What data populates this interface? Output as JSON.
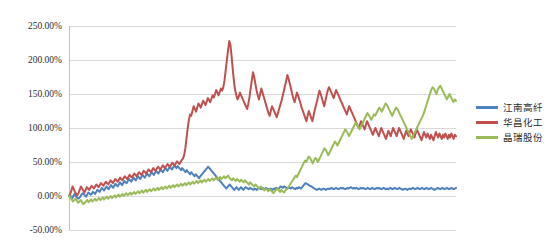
{
  "chart_data": {
    "type": "line",
    "title": "",
    "subtitle": "",
    "xlabel": "",
    "ylabel": "",
    "ylim": [
      -50,
      250
    ],
    "ytick_labels": [
      "250.00%",
      "200.00%",
      "150.00%",
      "100.00%",
      "50.00%",
      "0.00%",
      "-50.00%"
    ],
    "ytick_values": [
      250,
      200,
      150,
      100,
      50,
      0,
      -50
    ],
    "xtick_labels": [],
    "grid": "horizontal",
    "legend_position": "right",
    "colors": {
      "jiangnan": "#4F81BD",
      "huachang": "#C0504D",
      "jingrui": "#9BBB59",
      "gridline": "#D9D9D9",
      "axis": "#BFBFBF",
      "text": "#2B2B2B"
    },
    "series": [
      {
        "name": "江南高纤",
        "color": "#4F81BD",
        "values": [
          0,
          1,
          -2,
          -3,
          1,
          3,
          0,
          -2,
          -4,
          -3,
          -1,
          2,
          4,
          3,
          1,
          -1,
          2,
          5,
          4,
          2,
          3,
          6,
          5,
          3,
          6,
          9,
          8,
          6,
          9,
          12,
          10,
          8,
          11,
          14,
          12,
          10,
          13,
          16,
          14,
          12,
          15,
          18,
          16,
          14,
          17,
          20,
          18,
          16,
          19,
          22,
          20,
          19,
          22,
          25,
          23,
          21,
          24,
          27,
          25,
          23,
          26,
          29,
          27,
          25,
          28,
          31,
          29,
          27,
          30,
          33,
          31,
          29,
          32,
          35,
          33,
          31,
          34,
          37,
          35,
          33,
          36,
          39,
          37,
          35,
          38,
          41,
          39,
          37,
          40,
          43,
          41,
          39,
          42,
          45,
          43,
          41,
          44,
          42,
          40,
          38,
          41,
          39,
          37,
          35,
          38,
          36,
          34,
          32,
          35,
          33,
          31,
          29,
          32,
          30,
          28,
          26,
          29,
          31,
          33,
          35,
          37,
          39,
          41,
          43,
          41,
          39,
          37,
          35,
          33,
          31,
          29,
          27,
          25,
          23,
          21,
          19,
          17,
          15,
          13,
          11,
          13,
          15,
          17,
          15,
          13,
          11,
          9,
          11,
          13,
          11,
          9,
          11,
          13,
          11,
          9,
          11,
          13,
          12,
          11,
          10,
          12,
          11,
          10,
          9,
          11,
          10,
          9,
          11,
          12,
          11,
          10,
          12,
          11,
          10,
          12,
          11,
          10,
          9,
          11,
          10,
          9,
          11,
          10,
          12,
          11,
          10,
          12,
          14,
          13,
          12,
          14,
          13,
          12,
          11,
          13,
          12,
          11,
          13,
          12,
          11,
          10,
          12,
          11,
          13,
          12,
          11,
          13,
          15,
          17,
          19,
          18,
          17,
          16,
          15,
          14,
          13,
          12,
          11,
          10,
          9,
          10,
          11,
          10,
          9,
          10,
          11,
          10,
          9,
          10,
          11,
          10,
          11,
          12,
          11,
          10,
          11,
          12,
          11,
          10,
          11,
          12,
          11,
          12,
          11,
          10,
          11,
          12,
          11,
          12,
          13,
          12,
          11,
          12,
          11,
          12,
          11,
          10,
          11,
          12,
          11,
          12,
          11,
          10,
          11,
          12,
          11,
          10,
          11,
          12,
          11,
          10,
          11,
          12,
          11,
          12,
          11,
          10,
          11,
          12,
          11,
          10,
          11,
          10,
          11,
          12,
          11,
          10,
          11,
          12,
          11,
          10,
          11,
          12,
          11,
          10,
          9,
          10,
          11,
          10,
          9,
          10,
          11,
          10,
          11,
          12,
          11,
          10,
          11,
          12,
          11,
          10,
          11,
          12,
          11,
          10,
          11,
          12,
          11,
          10,
          11,
          12,
          11,
          10,
          9,
          10,
          11,
          12,
          11,
          10,
          11,
          12,
          11,
          10,
          11,
          12,
          11,
          10,
          11,
          12,
          11,
          10,
          11,
          12
        ]
      },
      {
        "name": "华昌化工",
        "color": "#C0504D",
        "values": [
          0,
          3,
          8,
          14,
          10,
          6,
          3,
          1,
          4,
          9,
          14,
          11,
          8,
          5,
          9,
          13,
          11,
          9,
          12,
          15,
          13,
          11,
          14,
          17,
          15,
          13,
          16,
          19,
          17,
          15,
          18,
          21,
          19,
          17,
          20,
          23,
          21,
          19,
          22,
          25,
          23,
          21,
          24,
          27,
          25,
          23,
          26,
          29,
          27,
          25,
          28,
          31,
          29,
          27,
          30,
          33,
          31,
          29,
          32,
          35,
          33,
          31,
          34,
          37,
          35,
          33,
          36,
          39,
          37,
          35,
          38,
          41,
          39,
          37,
          40,
          43,
          41,
          39,
          42,
          45,
          43,
          41,
          44,
          47,
          45,
          43,
          46,
          49,
          47,
          45,
          48,
          51,
          49,
          47,
          50,
          53,
          55,
          60,
          70,
          85,
          100,
          112,
          120,
          118,
          125,
          132,
          128,
          124,
          130,
          136,
          133,
          130,
          135,
          140,
          137,
          134,
          139,
          144,
          141,
          138,
          143,
          148,
          145,
          150,
          156,
          152,
          148,
          153,
          158,
          155,
          160,
          170,
          185,
          200,
          215,
          228,
          222,
          205,
          185,
          168,
          155,
          148,
          142,
          146,
          152,
          148,
          144,
          140,
          136,
          132,
          128,
          135,
          145,
          158,
          170,
          182,
          175,
          165,
          155,
          148,
          142,
          150,
          158,
          152,
          146,
          140,
          134,
          128,
          122,
          118,
          125,
          132,
          128,
          124,
          120,
          116,
          122,
          128,
          134,
          140,
          147,
          155,
          162,
          170,
          178,
          172,
          165,
          158,
          150,
          143,
          138,
          145,
          152,
          148,
          142,
          136,
          130,
          125,
          120,
          115,
          110,
          118,
          125,
          120,
          115,
          110,
          118,
          126,
          133,
          140,
          148,
          155,
          150,
          144,
          138,
          132,
          140,
          148,
          155,
          160,
          156,
          152,
          148,
          144,
          150,
          156,
          152,
          148,
          144,
          140,
          136,
          132,
          128,
          124,
          120,
          126,
          132,
          128,
          124,
          120,
          116,
          112,
          108,
          104,
          100,
          105,
          110,
          106,
          102,
          98,
          104,
          110,
          106,
          102,
          98,
          94,
          90,
          95,
          100,
          96,
          92,
          88,
          94,
          100,
          96,
          92,
          88,
          84,
          90,
          96,
          92,
          88,
          94,
          100,
          96,
          92,
          88,
          94,
          100,
          96,
          92,
          88,
          84,
          90,
          96,
          92,
          88,
          94,
          98,
          94,
          90,
          86,
          92,
          98,
          94,
          90,
          86,
          82,
          88,
          94,
          90,
          86,
          92,
          88,
          84,
          90,
          86,
          82,
          88,
          94,
          90,
          86,
          92,
          88,
          84,
          90,
          86,
          92,
          88,
          84,
          90,
          86,
          92,
          88,
          84,
          90,
          88
        ]
      },
      {
        "name": "晶瑞股份",
        "color": "#9BBB59",
        "values": [
          0,
          -2,
          -5,
          -8,
          -6,
          -4,
          -7,
          -10,
          -8,
          -6,
          -9,
          -12,
          -10,
          -8,
          -6,
          -9,
          -7,
          -5,
          -8,
          -6,
          -4,
          -7,
          -5,
          -3,
          -6,
          -4,
          -2,
          -5,
          -3,
          -1,
          -4,
          -2,
          0,
          -3,
          -1,
          1,
          -2,
          0,
          2,
          -1,
          1,
          3,
          0,
          2,
          4,
          1,
          3,
          5,
          2,
          4,
          6,
          3,
          5,
          7,
          4,
          6,
          8,
          5,
          7,
          9,
          6,
          8,
          10,
          7,
          9,
          11,
          8,
          10,
          12,
          9,
          11,
          13,
          10,
          12,
          14,
          11,
          13,
          15,
          12,
          14,
          16,
          13,
          15,
          17,
          14,
          16,
          18,
          15,
          17,
          19,
          16,
          18,
          20,
          17,
          19,
          21,
          18,
          20,
          22,
          19,
          21,
          23,
          20,
          22,
          24,
          21,
          23,
          25,
          22,
          24,
          26,
          23,
          25,
          27,
          24,
          26,
          28,
          25,
          27,
          29,
          26,
          28,
          30,
          27,
          25,
          23,
          26,
          24,
          22,
          25,
          23,
          21,
          24,
          22,
          20,
          23,
          21,
          19,
          17,
          20,
          18,
          16,
          14,
          17,
          15,
          13,
          11,
          14,
          12,
          10,
          8,
          11,
          9,
          7,
          10,
          8,
          6,
          4,
          7,
          9,
          11,
          8,
          6,
          9,
          7,
          5,
          8,
          10,
          12,
          15,
          18,
          21,
          24,
          27,
          30,
          28,
          32,
          36,
          40,
          44,
          48,
          52,
          50,
          54,
          58,
          56,
          52,
          48,
          52,
          56,
          54,
          50,
          54,
          58,
          62,
          66,
          70,
          68,
          64,
          60,
          64,
          68,
          72,
          76,
          80,
          78,
          74,
          78,
          82,
          86,
          90,
          94,
          98,
          95,
          92,
          88,
          92,
          96,
          100,
          104,
          108,
          105,
          102,
          98,
          102,
          106,
          110,
          114,
          118,
          122,
          119,
          116,
          112,
          116,
          120,
          118,
          122,
          126,
          130,
          128,
          124,
          128,
          132,
          136,
          134,
          130,
          126,
          122,
          118,
          122,
          126,
          130,
          128,
          124,
          120,
          116,
          112,
          108,
          104,
          100,
          96,
          92,
          88,
          84,
          88,
          92,
          96,
          100,
          104,
          108,
          112,
          116,
          120,
          126,
          132,
          138,
          144,
          150,
          156,
          160,
          158,
          154,
          150,
          156,
          160,
          162,
          158,
          154,
          150,
          146,
          142,
          146,
          150,
          146,
          142,
          138,
          142,
          140
        ]
      }
    ]
  },
  "legend": {
    "items": [
      {
        "label": "江南高纤",
        "color": "#4F81BD"
      },
      {
        "label": "华昌化工",
        "color": "#C0504D"
      },
      {
        "label": "晶瑞股份",
        "color": "#9BBB59"
      }
    ]
  },
  "axis": {
    "y_labels": [
      "250.00%",
      "200.00%",
      "150.00%",
      "100.00%",
      "50.00%",
      "0.00%",
      "-50.00%"
    ]
  }
}
